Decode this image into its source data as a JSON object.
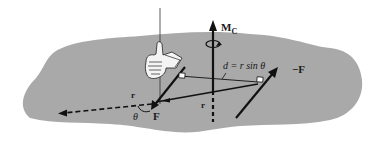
{
  "figure": {
    "colors": {
      "body_fill": "#a9a9a9",
      "line": "#111111",
      "background": "#ffffff",
      "hand": "#f4f4f4"
    }
  },
  "labels": {
    "moment": "M",
    "moment_sub": "C",
    "distance": "d = r sin θ",
    "force_pos": "F",
    "force_neg": "−F",
    "r_left": "r",
    "r_center": "r",
    "theta": "θ"
  },
  "icons": {
    "hand": "right-hand-thumb-up-icon",
    "rotation": "rotation-arrow-icon"
  }
}
